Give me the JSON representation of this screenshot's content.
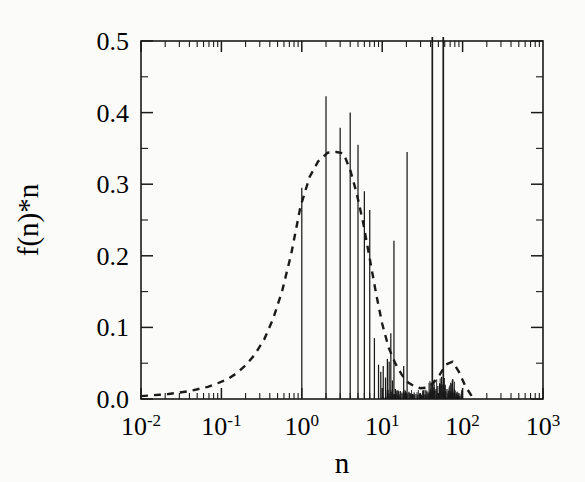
{
  "figure": {
    "background_color": "#fbfbfa",
    "line_color": "#1a1a1a",
    "axis_color": "#1a1a1a"
  },
  "chart_data": {
    "type": "line",
    "title": "",
    "subtitle": "",
    "xlabel": "n",
    "ylabel": "f(n)*n",
    "xscale": "log",
    "yscale": "linear",
    "xlim": [
      0.01,
      1000
    ],
    "ylim": [
      0.0,
      0.5
    ],
    "grid": false,
    "legend": null,
    "xtick_labels": [
      "10-2",
      "10-1",
      "100",
      "101",
      "102",
      "103"
    ],
    "xtick_mantissas": [
      "10",
      "10",
      "10",
      "10",
      "10",
      "10"
    ],
    "xtick_exponents": [
      "-2",
      "-1",
      "0",
      "1",
      "2",
      "3"
    ],
    "xtick_values": [
      0.01,
      0.1,
      1,
      10,
      100,
      1000
    ],
    "ytick_labels": [
      "0.0",
      "0.1",
      "0.2",
      "0.3",
      "0.4",
      "0.5"
    ],
    "ytick_values": [
      0.0,
      0.1,
      0.2,
      0.3,
      0.4,
      0.5
    ],
    "minor_ticks": true,
    "series": [
      {
        "name": "discrete spikes",
        "style": "vertical-stems",
        "linestyle": "solid",
        "x": [
          1,
          2,
          3,
          4,
          5,
          6,
          7,
          8,
          9,
          9.6,
          10.3,
          11,
          11.6,
          12.2,
          12.8,
          13.4,
          14,
          14.6,
          15.2,
          16,
          16.8,
          17.6,
          18.5,
          19.4,
          20.4,
          21.5,
          22.6,
          23.8,
          25,
          26.3,
          27.7,
          29.2,
          30.8,
          32.4,
          34.2,
          36,
          38,
          40,
          42,
          44.3,
          46.7,
          49.2,
          51.8,
          54.6,
          57.5,
          60.6,
          63.9,
          67.3,
          70.9,
          74.7,
          78.7,
          83,
          87.4,
          92.1,
          97
        ],
        "values": [
          0.295,
          0.423,
          0.379,
          0.4,
          0.355,
          0.29,
          0.264,
          0.085,
          0.048,
          0.038,
          0.046,
          0.03,
          0.056,
          0.052,
          0.092,
          0.026,
          0.221,
          0.014,
          0.012,
          0.01,
          0.011,
          0.009,
          0.046,
          0.012,
          0.345,
          0.01,
          0.008,
          0.007,
          0.009,
          0.007,
          0.006,
          0.008,
          0.006,
          0.012,
          0.007,
          0.01,
          0.009,
          0.013,
          0.52,
          0.011,
          0.014,
          0.018,
          0.022,
          0.031,
          0.52,
          0.019,
          0.014,
          0.012,
          0.01,
          0.009,
          0.007,
          0.006,
          0.005,
          0.004,
          0.003
        ]
      },
      {
        "name": "theoretical distribution",
        "style": "curve",
        "linestyle": "dashed",
        "x": [
          0.01,
          0.013,
          0.017,
          0.022,
          0.03,
          0.04,
          0.052,
          0.068,
          0.09,
          0.12,
          0.155,
          0.2,
          0.26,
          0.34,
          0.44,
          0.57,
          0.74,
          0.96,
          1.25,
          1.6,
          2.1,
          2.7,
          3.3,
          4.0,
          4.8,
          5.8,
          7.0,
          8.4,
          10.0,
          12.0,
          14.5,
          17.5,
          21.0,
          25.0,
          30.0,
          36.0,
          43.0,
          52.0,
          62.0,
          75.0,
          90.0,
          108.0,
          130.0
        ],
        "values": [
          0.004,
          0.005,
          0.006,
          0.007,
          0.009,
          0.011,
          0.014,
          0.017,
          0.022,
          0.028,
          0.036,
          0.047,
          0.062,
          0.083,
          0.112,
          0.151,
          0.203,
          0.268,
          0.31,
          0.332,
          0.344,
          0.345,
          0.343,
          0.32,
          0.288,
          0.246,
          0.196,
          0.147,
          0.105,
          0.072,
          0.05,
          0.034,
          0.023,
          0.018,
          0.015,
          0.016,
          0.022,
          0.034,
          0.048,
          0.052,
          0.038,
          0.018,
          0.004
        ]
      }
    ]
  }
}
